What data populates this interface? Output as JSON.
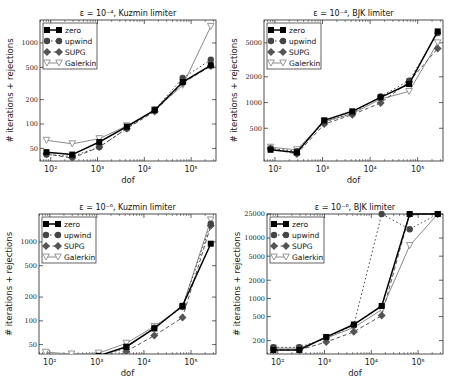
{
  "chart_data": [
    {
      "type": "line",
      "title": "ε = 10⁻⁴, Kuzmin limiter",
      "xlabel": "dof",
      "ylabel": "# iterations + rejections",
      "xscale": "log",
      "yscale": "log",
      "xlim": [
        59,
        340000
      ],
      "ylim": [
        35,
        1920
      ],
      "xticks": [
        {
          "v": 100,
          "label": "10²"
        },
        {
          "v": 1000,
          "label": "10³"
        },
        {
          "v": 10000,
          "label": "10⁴"
        },
        {
          "v": 100000,
          "label": "10⁵"
        }
      ],
      "yticks": [
        50,
        100,
        200,
        500,
        1000
      ],
      "legend": "top-left",
      "x": [
        81,
        289,
        1089,
        4225,
        16641,
        66049,
        263169
      ],
      "series": [
        {
          "name": "zero",
          "values": [
            45,
            42,
            60,
            93,
            148,
            330,
            530
          ]
        },
        {
          "name": "upwind",
          "values": [
            42,
            40,
            52,
            88,
            150,
            370,
            620
          ]
        },
        {
          "name": "SUPG",
          "values": [
            43,
            38,
            52,
            88,
            143,
            320,
            520
          ]
        },
        {
          "name": "Galerkin",
          "values": [
            63,
            57,
            66,
            95,
            150,
            300,
            1600
          ]
        }
      ]
    },
    {
      "type": "line",
      "title": "ε = 10⁻⁴, BJK limiter",
      "xlabel": "dof",
      "ylabel": "# iterations + rejections",
      "xscale": "log",
      "yscale": "log",
      "xlim": [
        59,
        340000
      ],
      "ylim": [
        207,
        9250
      ],
      "xticks": [
        {
          "v": 100,
          "label": "10²"
        },
        {
          "v": 1000,
          "label": "10³"
        },
        {
          "v": 10000,
          "label": "10⁴"
        },
        {
          "v": 100000,
          "label": "10⁵"
        }
      ],
      "yticks": [
        500,
        1000,
        2000,
        5000
      ],
      "legend": "top-left",
      "x": [
        81,
        289,
        1089,
        4225,
        16641,
        66049,
        263169
      ],
      "series": [
        {
          "name": "zero",
          "values": [
            280,
            260,
            620,
            790,
            1150,
            1650,
            6800
          ]
        },
        {
          "name": "upwind",
          "values": [
            290,
            270,
            590,
            750,
            1180,
            1800,
            6500
          ]
        },
        {
          "name": "SUPG",
          "values": [
            290,
            250,
            560,
            720,
            990,
            1750,
            4300
          ]
        },
        {
          "name": "Galerkin",
          "values": [
            300,
            280,
            600,
            740,
            1100,
            1350,
            5000
          ]
        }
      ]
    },
    {
      "type": "line",
      "title": "ε = 10⁻⁶, Kuzmin limiter",
      "xlabel": "dof",
      "ylabel": "# iterations + rejections",
      "xscale": "log",
      "yscale": "log",
      "xlim": [
        59,
        340000
      ],
      "ylim": [
        38,
        2260
      ],
      "xticks": [
        {
          "v": 100,
          "label": "10²"
        },
        {
          "v": 1000,
          "label": "10³"
        },
        {
          "v": 10000,
          "label": "10⁴"
        },
        {
          "v": 100000,
          "label": "10⁵"
        }
      ],
      "yticks": [
        50,
        100,
        200,
        500,
        1000
      ],
      "legend": "top-left",
      "x": [
        81,
        289,
        1089,
        4225,
        16641,
        66049,
        263169
      ],
      "series": [
        {
          "name": "zero",
          "values": [
            28,
            28,
            36,
            47,
            80,
            155,
            950
          ]
        },
        {
          "name": "upwind",
          "values": [
            26,
            26,
            33,
            46,
            82,
            150,
            1700
          ]
        },
        {
          "name": "SUPG",
          "values": [
            26,
            26,
            27,
            41,
            65,
            110,
            1600
          ]
        },
        {
          "name": "Galerkin",
          "values": [
            40,
            38,
            39,
            52,
            85,
            150,
            1900
          ]
        }
      ]
    },
    {
      "type": "line",
      "title": "ε = 10⁻⁶, BJK limiter",
      "xlabel": "dof",
      "ylabel": "# iterations + rejections",
      "xscale": "log",
      "yscale": "log",
      "xlim": [
        59,
        340000
      ],
      "ylim": [
        120,
        25000
      ],
      "xticks": [
        {
          "v": 100,
          "label": "10²"
        },
        {
          "v": 1000,
          "label": "10³"
        },
        {
          "v": 10000,
          "label": "10⁴"
        },
        {
          "v": 100000,
          "label": "10⁵"
        }
      ],
      "yticks": [
        200,
        500,
        1000,
        2000,
        5000,
        10000,
        25000
      ],
      "legend": "top-left",
      "x": [
        81,
        289,
        1089,
        4225,
        16641,
        66049,
        263169
      ],
      "series": [
        {
          "name": "zero",
          "values": [
            140,
            140,
            230,
            370,
            750,
            25000,
            25000
          ]
        },
        {
          "name": "upwind",
          "values": [
            155,
            155,
            220,
            360,
            25000,
            14000,
            25000
          ]
        },
        {
          "name": "SUPG",
          "values": [
            140,
            140,
            190,
            280,
            520,
            25000,
            25000
          ]
        },
        {
          "name": "Galerkin",
          "values": [
            150,
            150,
            220,
            330,
            650,
            7500,
            25000
          ]
        }
      ]
    }
  ],
  "styles": {
    "zero": {
      "color": "#000000",
      "marker": "square",
      "dash": ""
    },
    "upwind": {
      "color": "#444444",
      "marker": "circle",
      "dash": "1.5,2.5"
    },
    "SUPG": {
      "color": "#555555",
      "marker": "diamond",
      "dash": "4,2.5"
    },
    "Galerkin": {
      "color": "#8a8a8a",
      "marker": "triangle-down",
      "dash": ""
    }
  }
}
